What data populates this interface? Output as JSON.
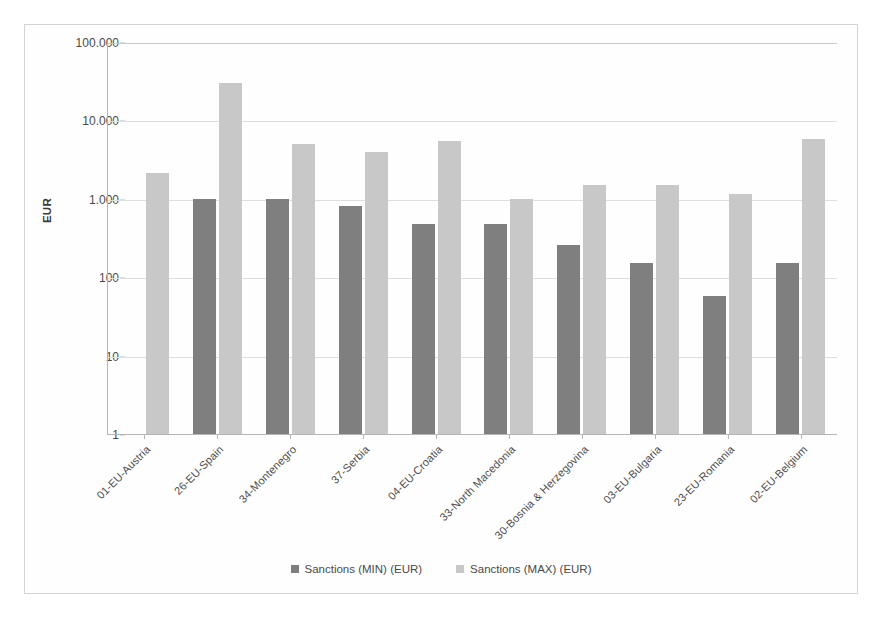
{
  "chart_data": {
    "type": "bar",
    "title": "",
    "xlabel": "",
    "ylabel": "EUR",
    "yscale": "log",
    "ylim": [
      1,
      100000
    ],
    "ytick_labels": [
      "100.000",
      "10.000",
      "1.000",
      "100",
      "10",
      "1"
    ],
    "ytick_values": [
      100000,
      10000,
      1000,
      100,
      10,
      1
    ],
    "grid": true,
    "legend_position": "bottom",
    "categories": [
      "01-EU-Austria",
      "26-EU-Spain",
      "34-Montenegro",
      "37-Serbia",
      "04-EU-Croatia",
      "33-North Macedonia",
      "30-Bosnia & Herzegovina",
      "03-EU-Bulgaria",
      "23-EU-Romania",
      "02-EU-Belgium"
    ],
    "series": [
      {
        "name": "Sanctions (MIN) (EUR)",
        "color": "#7f7f7f",
        "values": [
          null,
          1000,
          1000,
          800,
          480,
          480,
          260,
          150,
          58,
          150
        ]
      },
      {
        "name": "Sanctions (MAX) (EUR)",
        "color": "#c8c8c8",
        "values": [
          2150,
          30000,
          5000,
          3900,
          5500,
          1000,
          1500,
          1500,
          1150,
          5800
        ]
      }
    ]
  },
  "legend": {
    "items": [
      {
        "label": "Sanctions (MIN) (EUR)",
        "color": "#7f7f7f"
      },
      {
        "label": "Sanctions (MAX) (EUR)",
        "color": "#c8c8c8"
      }
    ]
  },
  "colors": {
    "min_series": "#7f7f7f",
    "max_series": "#c8c8c8",
    "grid": "#dedede",
    "axis": "#b5b5b5",
    "frame": "#d4d4d4",
    "text": "#4a4a4a"
  }
}
